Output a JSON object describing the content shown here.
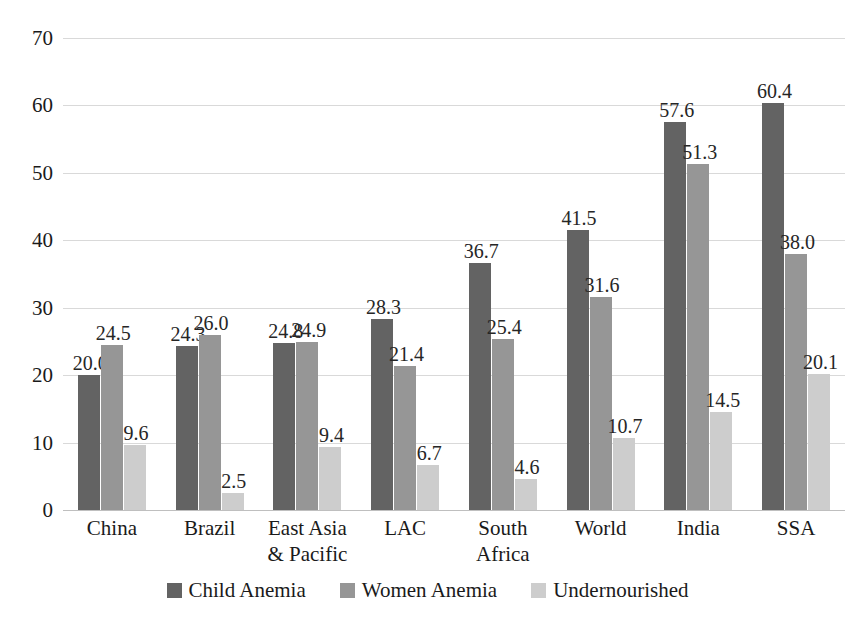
{
  "chart_data": {
    "type": "bar",
    "title": "",
    "subtitle": "",
    "xlabel": "",
    "ylabel": "",
    "ylim": [
      0,
      70
    ],
    "ytick_step": 10,
    "yticks": [
      "70",
      "60",
      "50",
      "40",
      "30",
      "20",
      "10",
      "0"
    ],
    "grid": true,
    "legend_position": "bottom",
    "orientation": "vertical",
    "grouped": true,
    "categories": [
      "China",
      "Brazil",
      "East Asia\n& Pacific",
      "LAC",
      "South\nAfrica",
      "World",
      "India",
      "SSA"
    ],
    "series": [
      {
        "name": "Child Anemia",
        "color": "#636363",
        "values": [
          20.0,
          24.3,
          24.8,
          28.3,
          36.7,
          41.5,
          57.6,
          60.4
        ],
        "labels": [
          "20.0",
          "24.3",
          "24.8",
          "28.3",
          "36.7",
          "41.5",
          "57.6",
          "60.4"
        ]
      },
      {
        "name": "Women Anemia",
        "color": "#969696",
        "values": [
          24.5,
          26.0,
          24.9,
          21.4,
          25.4,
          31.6,
          51.3,
          38.0
        ],
        "labels": [
          "24.5",
          "26.0",
          "24.9",
          "21.4",
          "25.4",
          "31.6",
          "51.3",
          "38.0"
        ]
      },
      {
        "name": "Undernourished",
        "color": "#cdcdcd",
        "values": [
          9.6,
          2.5,
          9.4,
          6.7,
          4.6,
          10.7,
          14.5,
          20.1
        ],
        "labels": [
          "9.6",
          "2.5",
          "9.4",
          "6.7",
          "4.6",
          "10.7",
          "14.5",
          "20.1"
        ]
      }
    ]
  },
  "legend": {
    "items": [
      {
        "label": "Child Anemia",
        "color": "#636363"
      },
      {
        "label": "Women Anemia",
        "color": "#969696"
      },
      {
        "label": "Undernourished",
        "color": "#cdcdcd"
      }
    ]
  }
}
